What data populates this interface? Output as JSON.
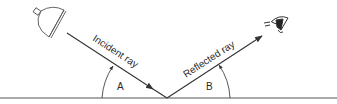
{
  "diagram": {
    "type": "reflection-of-light",
    "labels": {
      "incident_ray": "Incident ray",
      "reflected_ray": "Reflected ray",
      "angle_incidence": "A",
      "angle_reflection": "B"
    },
    "icons": {
      "light_source": "lamp-icon",
      "observer": "eye-icon"
    },
    "colors": {
      "line": "#333333",
      "background": "#ffffff"
    }
  }
}
